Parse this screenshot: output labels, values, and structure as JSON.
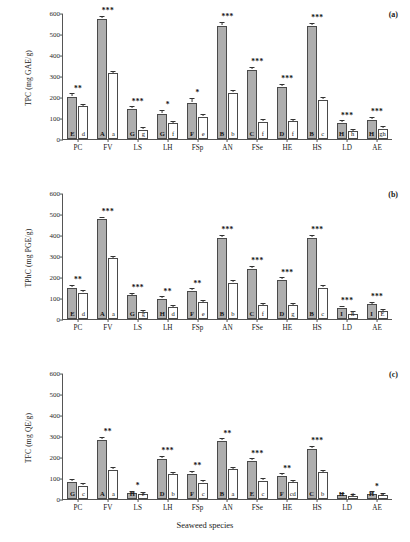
{
  "figure": {
    "xaxis_title": "Seaweed species",
    "panel_tags": [
      "(a)",
      "(b)",
      "(c)"
    ]
  },
  "chart_data": [
    {
      "type": "bar",
      "title": "(a)",
      "ylabel": "TPC (mg GAE/g)",
      "xlabel": "Seaweed species",
      "ylim": [
        0,
        600
      ],
      "yticks": [
        0,
        100,
        200,
        300,
        400,
        500,
        600
      ],
      "grid": false,
      "legend": "none",
      "categories": [
        "PC",
        "FV",
        "LS",
        "LH",
        "FSp",
        "AN",
        "FSe",
        "HE",
        "HS",
        "LD",
        "AE"
      ],
      "series": [
        {
          "name": "grey-bar",
          "values": [
            200,
            573,
            142,
            120,
            173,
            540,
            328,
            250,
            538,
            78,
            92
          ],
          "errors": [
            9,
            6,
            4,
            11,
            14,
            8,
            7,
            4,
            5,
            3,
            5
          ],
          "letters": [
            "E",
            "A",
            "G",
            "G",
            "F",
            "B",
            "C",
            "D",
            "B",
            "H",
            "H"
          ]
        },
        {
          "name": "white-bar",
          "values": [
            155,
            312,
            45,
            75,
            107,
            220,
            82,
            84,
            188,
            38,
            50
          ],
          "errors": [
            4,
            2,
            2,
            3,
            3,
            5,
            2,
            2,
            2,
            2,
            2
          ],
          "letters": [
            "d",
            "a",
            "g",
            "f",
            "e",
            "b",
            "f",
            "f",
            "c",
            "h",
            "gh"
          ]
        }
      ],
      "significance": [
        "**",
        "***",
        "***",
        "*",
        "*",
        "***",
        "***",
        "***",
        "***",
        "***",
        "***"
      ]
    },
    {
      "type": "bar",
      "title": "(b)",
      "ylabel": "TPhC (mg PGE/g)",
      "xlabel": "Seaweed species",
      "ylim": [
        0,
        600
      ],
      "yticks": [
        0,
        100,
        200,
        300,
        400,
        500,
        600
      ],
      "grid": false,
      "legend": "none",
      "categories": [
        "PC",
        "FV",
        "LS",
        "LH",
        "FSp",
        "AN",
        "FSe",
        "HE",
        "HS",
        "LD",
        "AE"
      ],
      "series": [
        {
          "name": "grey-bar",
          "values": [
            150,
            475,
            113,
            95,
            132,
            388,
            240,
            185,
            387,
            52,
            70
          ],
          "errors": [
            5,
            4,
            3,
            5,
            5,
            4,
            4,
            4,
            4,
            3,
            3
          ],
          "letters": [
            "E",
            "A",
            "G",
            "H",
            "F",
            "B",
            "C",
            "D",
            "B",
            "I",
            "I"
          ]
        },
        {
          "name": "white-bar",
          "values": [
            125,
            290,
            33,
            55,
            80,
            172,
            65,
            65,
            150,
            25,
            38
          ],
          "errors": [
            3,
            2,
            2,
            3,
            2,
            3,
            2,
            2,
            2,
            2,
            2
          ],
          "letters": [
            "d",
            "a",
            "g",
            "d",
            "e",
            "b",
            "f",
            "g",
            "c",
            "h",
            "E"
          ]
        }
      ],
      "significance": [
        "**",
        "***",
        "***",
        "**",
        "**",
        "***",
        "***",
        "***",
        "***",
        "***",
        "***"
      ]
    },
    {
      "type": "bar",
      "title": "(c)",
      "ylabel": "TFC (mg QE/g)",
      "xlabel": "Seaweed species",
      "ylim": [
        0,
        600
      ],
      "yticks": [
        0,
        100,
        200,
        300,
        400,
        500,
        600
      ],
      "grid": false,
      "legend": "none",
      "categories": [
        "PC",
        "FV",
        "LS",
        "LH",
        "FSp",
        "AN",
        "FSe",
        "HE",
        "HS",
        "LD",
        "AE"
      ],
      "series": [
        {
          "name": "grey-bar",
          "values": [
            80,
            283,
            28,
            192,
            120,
            275,
            180,
            110,
            240,
            18,
            25
          ],
          "errors": [
            4,
            4,
            2,
            4,
            5,
            5,
            4,
            3,
            5,
            2,
            3
          ],
          "letters": [
            "G",
            "A",
            "H",
            "D",
            "F",
            "B",
            "E",
            "F",
            "C",
            "H",
            "H"
          ]
        },
        {
          "name": "white-bar",
          "values": [
            62,
            140,
            22,
            117,
            77,
            142,
            87,
            80,
            128,
            14,
            18
          ],
          "errors": [
            3,
            4,
            2,
            3,
            5,
            3,
            2,
            2,
            3,
            2,
            2
          ],
          "letters": [
            "c",
            "a",
            "e",
            "b",
            "c",
            "a",
            "c",
            "cd",
            "b",
            "e",
            "e"
          ]
        }
      ],
      "significance": [
        "",
        "**",
        "*",
        "***",
        "**",
        "**",
        "***",
        "**",
        "***",
        "",
        "*"
      ]
    }
  ]
}
